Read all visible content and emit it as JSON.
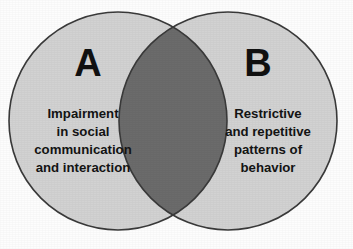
{
  "figure": {
    "type": "venn-diagram",
    "title": "",
    "background_color": "#fdfdfd",
    "circle_fill_color": "#d2d2d2",
    "overlap_fill_color": "#6b6b6b",
    "outline_color": "#3a3a3a",
    "text_color": "#141414"
  },
  "sets": {
    "left": {
      "letter": "A",
      "lines": [
        "Impairment",
        "in social",
        "communication",
        "and interaction"
      ],
      "center_x": 118,
      "center_y": 121,
      "radius": 109
    },
    "right": {
      "letter": "B",
      "lines": [
        "Restrictive",
        "and repetitive",
        "patterns of",
        "behavior"
      ],
      "center_x": 228,
      "center_y": 121,
      "radius": 109
    }
  },
  "intersection": {
    "label": "",
    "top_point_x": 173,
    "top_point_y": 27,
    "bottom_point_x": 173,
    "bottom_point_y": 215
  },
  "chart_data": {
    "type": "venn",
    "title": "",
    "categories": [
      "A",
      "B"
    ],
    "series": [
      {
        "name": "A",
        "label": "A",
        "description": "Impairment in social communication and interaction"
      },
      {
        "name": "B",
        "label": "B",
        "description": "Restrictive and repetitive patterns of behavior"
      }
    ],
    "overlap_label": "",
    "legend": "none",
    "grid": false
  }
}
